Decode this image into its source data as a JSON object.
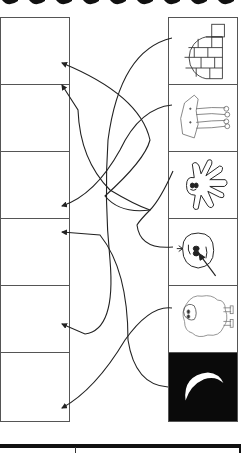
{
  "worksheet": {
    "type": "matching-activity",
    "left_column": {
      "boxes": [
        {
          "index": 1,
          "content": ""
        },
        {
          "index": 2,
          "content": ""
        },
        {
          "index": 3,
          "content": ""
        },
        {
          "index": 4,
          "content": ""
        },
        {
          "index": 5,
          "content": ""
        },
        {
          "index": 6,
          "content": ""
        }
      ]
    },
    "right_column": {
      "pictures": [
        {
          "index": 1,
          "icon": "igloo-icon"
        },
        {
          "index": 2,
          "icon": "elephant-icon"
        },
        {
          "index": 3,
          "icon": "octopus-icon"
        },
        {
          "index": 4,
          "icon": "face-with-arrow-icon"
        },
        {
          "index": 5,
          "icon": "sheep-icon"
        },
        {
          "index": 6,
          "icon": "moon-icon",
          "background": "#0a0a0a"
        }
      ]
    },
    "connections": [
      {
        "from_picture": 1,
        "to_box": 5
      },
      {
        "from_picture": 2,
        "to_box": 3
      },
      {
        "from_picture": 3,
        "to_box": 1
      },
      {
        "from_picture": 4,
        "to_box": 2
      },
      {
        "from_picture": 5,
        "to_box": 4
      },
      {
        "from_picture": 6,
        "to_box": 6
      }
    ],
    "colors": {
      "line": "#222222",
      "border": "#555555",
      "dark_cell": "#0a0a0a"
    }
  }
}
